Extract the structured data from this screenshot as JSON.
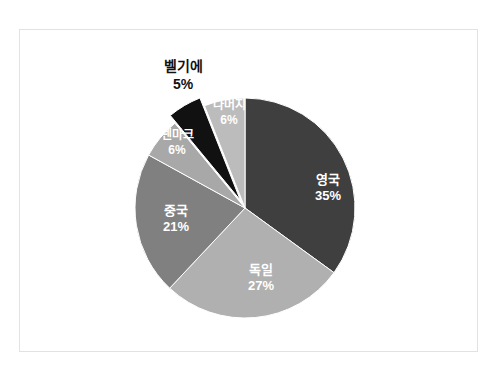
{
  "chart_data": {
    "type": "pie",
    "title": "",
    "subtitle": "",
    "xlabel": "",
    "ylabel": "",
    "legend_position": "none",
    "grid": false,
    "value_unit": "%",
    "start_angle_deg": 0,
    "direction": "clockwise",
    "categories": [
      "영국",
      "독일",
      "중국",
      "덴마크",
      "벨기에",
      "나머지"
    ],
    "values": [
      35,
      27,
      21,
      6,
      5,
      6
    ],
    "labels": [
      "35%",
      "27%",
      "21%",
      "6%",
      "5%",
      "6%"
    ],
    "colors": [
      "#3f3f3f",
      "#b0b0b0",
      "#808080",
      "#a8a8a8",
      "#111111",
      "#bcbcbc"
    ],
    "slices": [
      {
        "name": "영국",
        "value": 35,
        "label": "35%",
        "color": "#3f3f3f",
        "label_placement": "inside",
        "label_color": "#ffffff",
        "exploded": false
      },
      {
        "name": "독일",
        "value": 27,
        "label": "27%",
        "color": "#b0b0b0",
        "label_placement": "inside",
        "label_color": "#ffffff",
        "exploded": false
      },
      {
        "name": "중국",
        "value": 21,
        "label": "21%",
        "color": "#808080",
        "label_placement": "inside",
        "label_color": "#ffffff",
        "exploded": false
      },
      {
        "name": "덴마크",
        "value": 6,
        "label": "6%",
        "color": "#a8a8a8",
        "label_placement": "inside",
        "label_color": "#ffffff",
        "exploded": false
      },
      {
        "name": "벨기에",
        "value": 5,
        "label": "5%",
        "color": "#111111",
        "label_placement": "outside",
        "label_color": "#111111",
        "exploded": true
      },
      {
        "name": "나머지",
        "value": 6,
        "label": "6%",
        "color": "#bcbcbc",
        "label_placement": "inside",
        "label_color": "#ffffff",
        "exploded": false
      }
    ],
    "total": 100
  },
  "figure": {
    "background_color": "#ffffff",
    "frame_color": "#e2e2e2"
  }
}
